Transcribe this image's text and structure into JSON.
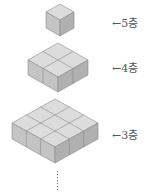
{
  "layers": [
    {
      "label": "5층",
      "arrow": "←",
      "size": 1
    },
    {
      "label": "4층",
      "arrow": "←",
      "size": 2
    },
    {
      "label": "3층",
      "arrow": "←",
      "size": 3
    }
  ],
  "continuation": "⋮",
  "colors": {
    "top": "#dcdcdc",
    "left": "#c4c4c4",
    "right": "#b0b0b0",
    "edge": "#8a8a8a",
    "text": "#555555"
  }
}
